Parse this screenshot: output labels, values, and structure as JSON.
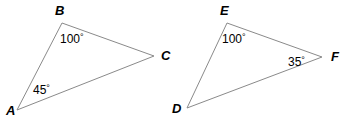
{
  "figure": {
    "type": "geometry-diagram",
    "canvas": {
      "width": 359,
      "height": 125
    },
    "colors": {
      "background": "#ffffff",
      "stroke": "#8a8a8a",
      "text": "#000000"
    },
    "stroke_width": 1,
    "degree_symbol": "°"
  },
  "shapes": [
    {
      "name": "triangle-abc",
      "vertices": [
        {
          "id": "A",
          "x": 17,
          "y": 110
        },
        {
          "id": "B",
          "x": 62,
          "y": 23
        },
        {
          "id": "C",
          "x": 154,
          "y": 56
        }
      ],
      "vertex_labels": [
        {
          "id": "A",
          "text": "A",
          "x": 6,
          "y": 104
        },
        {
          "id": "B",
          "text": "B",
          "x": 55,
          "y": 4
        },
        {
          "id": "C",
          "text": "C",
          "x": 161,
          "y": 49
        }
      ],
      "angle_labels": [
        {
          "at": "B",
          "text": "100",
          "x": 60,
          "y": 33
        },
        {
          "at": "A",
          "text": "45",
          "x": 33,
          "y": 84
        }
      ]
    },
    {
      "name": "triangle-def",
      "vertices": [
        {
          "id": "D",
          "x": 187,
          "y": 108
        },
        {
          "id": "E",
          "x": 227,
          "y": 23
        },
        {
          "id": "F",
          "x": 322,
          "y": 57
        }
      ],
      "vertex_labels": [
        {
          "id": "D",
          "text": "D",
          "x": 172,
          "y": 102
        },
        {
          "id": "E",
          "text": "E",
          "x": 220,
          "y": 4
        },
        {
          "id": "F",
          "text": "F",
          "x": 331,
          "y": 50
        }
      ],
      "angle_labels": [
        {
          "at": "E",
          "text": "100",
          "x": 222,
          "y": 33
        },
        {
          "at": "F",
          "text": "35",
          "x": 288,
          "y": 56
        }
      ]
    }
  ]
}
